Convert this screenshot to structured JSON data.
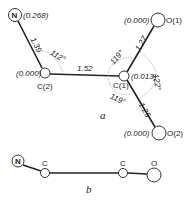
{
  "diagram_a": {
    "caption": "a",
    "atoms": {
      "N": {
        "symbol": "N",
        "charge": "(0.268)"
      },
      "C2": {
        "label": "C(2)",
        "charge": "(0.000)"
      },
      "C1": {
        "label": "C(1)",
        "charge": "(0.013)"
      },
      "O1": {
        "label": "O(1)",
        "charge": "(0.000)"
      },
      "O2": {
        "label": "O(2)",
        "charge": "(0.000)"
      }
    },
    "bonds": {
      "N_C2": "1.39",
      "C2_C1": "1.52",
      "C1_O1": "1.27",
      "C1_O2": "1.25"
    },
    "angles": {
      "N_C2_C1": "112°",
      "C2_C1_O1": "119°",
      "O1_C1_O2": "122°",
      "C2_C1_O2": "119°"
    }
  },
  "diagram_b": {
    "caption": "b",
    "atoms": {
      "N": "N",
      "C_left": "C",
      "C_right": "C",
      "O": "O"
    }
  }
}
